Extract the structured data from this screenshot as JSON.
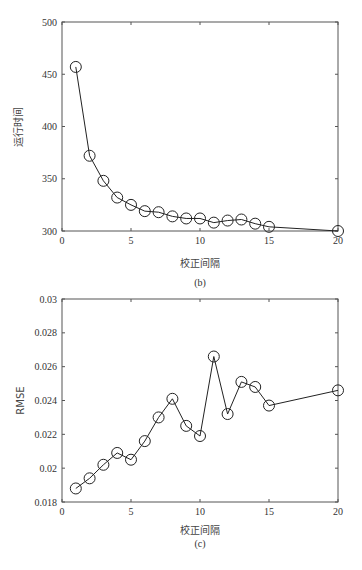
{
  "chart_data": [
    {
      "type": "line",
      "title": "",
      "caption": "(b)",
      "xlabel": "校正间隔",
      "ylabel": "运行时间",
      "x": [
        1,
        2,
        3,
        4,
        5,
        6,
        7,
        8,
        9,
        10,
        11,
        12,
        13,
        14,
        15,
        20
      ],
      "series": [
        {
          "name": "运行时间",
          "marker": "circle",
          "values": [
            457,
            372,
            348,
            332,
            325,
            319,
            318,
            314,
            312,
            312,
            308,
            310,
            311,
            307,
            304,
            300
          ]
        }
      ],
      "xlim": [
        0,
        20
      ],
      "ylim": [
        300,
        500
      ],
      "xticks": [
        0,
        5,
        10,
        15,
        20
      ],
      "yticks": [
        300,
        350,
        400,
        450,
        500
      ],
      "xtick_labels": [
        "0",
        "5",
        "10",
        "15",
        "20"
      ],
      "ytick_labels": [
        "300",
        "350",
        "400",
        "450",
        "500"
      ],
      "grid": false,
      "legend": null
    },
    {
      "type": "line",
      "title": "",
      "caption": "(c)",
      "xlabel": "校正间隔",
      "ylabel": "RMSE",
      "x": [
        1,
        2,
        3,
        4,
        5,
        6,
        7,
        8,
        9,
        10,
        11,
        12,
        13,
        14,
        15,
        20
      ],
      "series": [
        {
          "name": "RMSE",
          "marker": "circle",
          "values": [
            0.0188,
            0.0194,
            0.0202,
            0.0209,
            0.0205,
            0.0216,
            0.023,
            0.0241,
            0.0225,
            0.0219,
            0.0266,
            0.0232,
            0.0251,
            0.0248,
            0.0237,
            0.0246
          ]
        }
      ],
      "xlim": [
        0,
        20
      ],
      "ylim": [
        0.018,
        0.03
      ],
      "xticks": [
        0,
        5,
        10,
        15,
        20
      ],
      "yticks": [
        0.018,
        0.02,
        0.022,
        0.024,
        0.026,
        0.028,
        0.03
      ],
      "xtick_labels": [
        "0",
        "5",
        "10",
        "15",
        "20"
      ],
      "ytick_labels": [
        "0.018",
        "0.02",
        "0.022",
        "0.024",
        "0.026",
        "0.028",
        "0.03"
      ],
      "grid": false,
      "legend": null
    }
  ],
  "colors": {
    "line": "#222222",
    "axis": "#555555",
    "background": "#ffffff"
  }
}
